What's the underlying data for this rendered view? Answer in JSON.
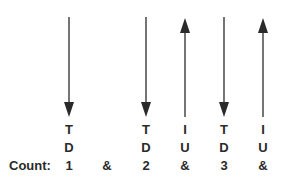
{
  "count_label": "Count:",
  "colors": {
    "ink": "#2a2a2a",
    "background": "#ffffff"
  },
  "beats": [
    {
      "x": 69,
      "count": "1",
      "direction": "down",
      "finger": "T",
      "stroke": "D"
    },
    {
      "x": 107,
      "count": "&",
      "direction": null,
      "finger": "",
      "stroke": ""
    },
    {
      "x": 146,
      "count": "2",
      "direction": "down",
      "finger": "T",
      "stroke": "D"
    },
    {
      "x": 185,
      "count": "&",
      "direction": "up",
      "finger": "I",
      "stroke": "U"
    },
    {
      "x": 224,
      "count": "3",
      "direction": "down",
      "finger": "T",
      "stroke": "D"
    },
    {
      "x": 263,
      "count": "&",
      "direction": "up",
      "finger": "I",
      "stroke": "U"
    }
  ]
}
